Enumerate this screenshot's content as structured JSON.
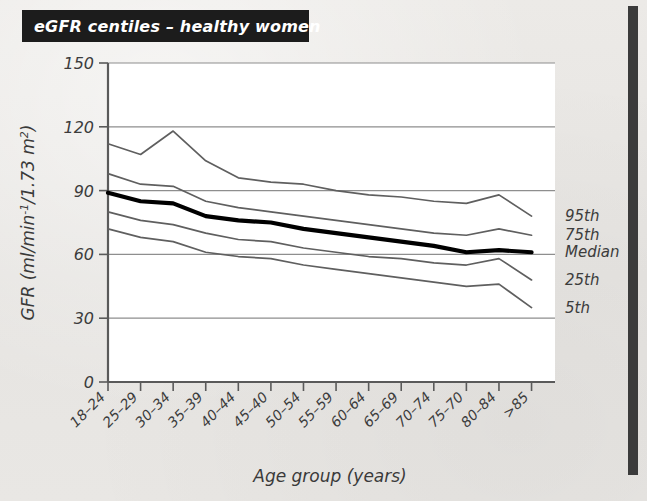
{
  "figure": {
    "title": "eGFR centiles – healthy women",
    "title_bg_color": "#1c1c1c",
    "title_text_color": "#ffffff",
    "background_color": "#e8e7e4",
    "plot_background_color": "#ffffff",
    "accent_bar_color": "#3b3b3b"
  },
  "chart_data": {
    "type": "line",
    "title": "eGFR centiles – healthy women",
    "xlabel": "Age group (years)",
    "ylabel": "GFR (ml/min⁻¹/1.73 m²)",
    "ylabel_parts": {
      "prefix": "GFR (ml/min",
      "sup1": "-1",
      "mid": "/1.73 m",
      "sup2": "2",
      "suffix": ")"
    },
    "categories": [
      "18–24",
      "25–29",
      "30–34",
      "35–39",
      "40–44",
      "45–40",
      "50–54",
      "55–59",
      "60–64",
      "65–69",
      "70–74",
      "75–70",
      "80–84",
      ">85"
    ],
    "yticks": [
      0,
      30,
      60,
      90,
      120,
      150
    ],
    "ylim": [
      0,
      150
    ],
    "grid": true,
    "legend_position": "right",
    "series": [
      {
        "name": "95th",
        "label": "95th",
        "style": "thin",
        "values": [
          112,
          107,
          118,
          104,
          96,
          94,
          93,
          90,
          88,
          87,
          85,
          84,
          88,
          78
        ]
      },
      {
        "name": "75th",
        "label": "75th",
        "style": "thin",
        "values": [
          98,
          93,
          92,
          85,
          82,
          80,
          78,
          76,
          74,
          72,
          70,
          69,
          72,
          69
        ]
      },
      {
        "name": "Median",
        "label": "Median",
        "style": "thick",
        "values": [
          89,
          85,
          84,
          78,
          76,
          75,
          72,
          70,
          68,
          66,
          64,
          61,
          62,
          61
        ]
      },
      {
        "name": "25th",
        "label": "25th",
        "style": "thin",
        "values": [
          80,
          76,
          74,
          70,
          67,
          66,
          63,
          61,
          59,
          58,
          56,
          55,
          58,
          48
        ]
      },
      {
        "name": "5th",
        "label": "5th",
        "style": "thin",
        "values": [
          72,
          68,
          66,
          61,
          59,
          58,
          55,
          53,
          51,
          49,
          47,
          45,
          46,
          35
        ]
      }
    ]
  }
}
